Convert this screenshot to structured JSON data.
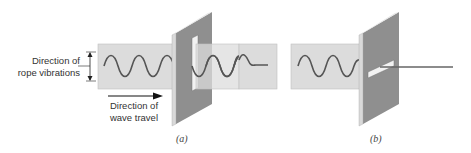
{
  "labels": {
    "rope_vibrations_line1": "Direction of",
    "rope_vibrations_line2": "rope vibrations",
    "wave_travel_line1": "Direction of",
    "wave_travel_line2": "wave travel"
  },
  "captions": {
    "a": "(a)",
    "b": "(b)"
  },
  "colors": {
    "band": "#dcdcdc",
    "band_border": "#b8b8b8",
    "plate": "#8e8e8e",
    "plate_edge": "#d8d8d8",
    "rope": "#555555",
    "arrow": "#111111"
  }
}
